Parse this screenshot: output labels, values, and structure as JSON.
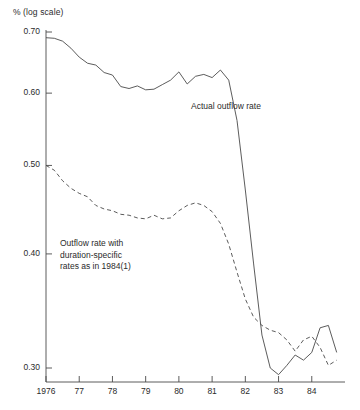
{
  "chart_data": {
    "type": "line",
    "title": "",
    "ylabel": "% (log scale)",
    "xlabel": "",
    "yscale": "log",
    "ylim": [
      0.285,
      0.715
    ],
    "xlim": [
      1976,
      1985
    ],
    "grid": false,
    "legend_position": "inline-annotations",
    "ytick_labels": [
      "0.70",
      "0.60",
      "0.50",
      "0.40",
      "0.30"
    ],
    "ytick_values": [
      0.7,
      0.6,
      0.5,
      0.4,
      0.3
    ],
    "xtick_labels": [
      "1976",
      "77",
      "78",
      "79",
      "80",
      "81",
      "82",
      "83",
      "84"
    ],
    "xtick_values": [
      1976,
      1977,
      1978,
      1979,
      1980,
      1981,
      1982,
      1983,
      1984
    ],
    "series": [
      {
        "name": "Actual outflow rate",
        "style": "solid",
        "color": "#4a4a4a",
        "annotation": "Actual outflow rate",
        "x": [
          1976.0,
          1976.25,
          1976.5,
          1976.75,
          1977.0,
          1977.25,
          1977.5,
          1977.75,
          1978.0,
          1978.25,
          1978.5,
          1978.75,
          1979.0,
          1979.25,
          1979.5,
          1979.75,
          1980.0,
          1980.25,
          1980.5,
          1980.75,
          1981.0,
          1981.25,
          1981.5,
          1981.75,
          1982.0,
          1982.25,
          1982.5,
          1982.75,
          1983.0,
          1983.25,
          1983.5,
          1983.75,
          1984.0,
          1984.25,
          1984.5,
          1984.75
        ],
        "y": [
          0.69,
          0.689,
          0.684,
          0.672,
          0.657,
          0.647,
          0.644,
          0.632,
          0.628,
          0.61,
          0.607,
          0.611,
          0.605,
          0.606,
          0.613,
          0.62,
          0.633,
          0.614,
          0.626,
          0.629,
          0.624,
          0.636,
          0.62,
          0.56,
          0.47,
          0.39,
          0.326,
          0.3,
          0.295,
          0.302,
          0.31,
          0.306,
          0.312,
          0.332,
          0.334,
          0.312
        ]
      },
      {
        "name": "Outflow rate with duration-specific rates as in 1984(1)",
        "style": "dashed",
        "color": "#4a4a4a",
        "annotation": "Outflow rate with\nduration-specific\nrates as in 1984(1)",
        "x": [
          1976.0,
          1976.25,
          1976.5,
          1976.75,
          1977.0,
          1977.25,
          1977.5,
          1977.75,
          1978.0,
          1978.25,
          1978.5,
          1978.75,
          1979.0,
          1979.25,
          1979.5,
          1979.75,
          1980.0,
          1980.25,
          1980.5,
          1980.75,
          1981.0,
          1981.25,
          1981.5,
          1981.75,
          1982.0,
          1982.25,
          1982.5,
          1982.75,
          1983.0,
          1983.25,
          1983.5,
          1983.75,
          1984.0,
          1984.25,
          1984.5,
          1984.75
        ],
        "y": [
          0.5,
          0.494,
          0.481,
          0.472,
          0.466,
          0.462,
          0.452,
          0.448,
          0.446,
          0.442,
          0.441,
          0.438,
          0.437,
          0.441,
          0.437,
          0.438,
          0.446,
          0.452,
          0.455,
          0.452,
          0.445,
          0.432,
          0.41,
          0.382,
          0.357,
          0.341,
          0.334,
          0.33,
          0.328,
          0.322,
          0.313,
          0.322,
          0.325,
          0.316,
          0.302,
          0.306
        ]
      }
    ]
  },
  "axes": {
    "y_axis_caption": "% (log scale)"
  }
}
